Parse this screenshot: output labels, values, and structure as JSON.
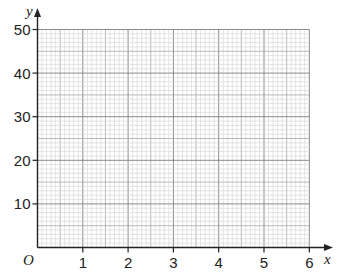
{
  "chart_data": {
    "type": "line",
    "title": "",
    "xlabel": "x",
    "ylabel": "y",
    "origin_label": "O",
    "xlim": [
      0,
      6
    ],
    "ylim": [
      0,
      50
    ],
    "x_ticks": [
      1,
      2,
      3,
      4,
      5,
      6
    ],
    "y_ticks": [
      10,
      20,
      30,
      40,
      50
    ],
    "x_tick_labels": [
      "1",
      "2",
      "3",
      "4",
      "5",
      "6"
    ],
    "y_tick_labels": [
      "10",
      "20",
      "30",
      "40",
      "50"
    ],
    "grid": true,
    "grid_minor_x_step": 0.1,
    "grid_minor_y_step": 1,
    "series": []
  },
  "colors": {
    "axis": "#222222",
    "grid_major": "#8a8a8a",
    "grid_mid": "#a8a8a8",
    "grid_minor": "#d2d2d2"
  }
}
